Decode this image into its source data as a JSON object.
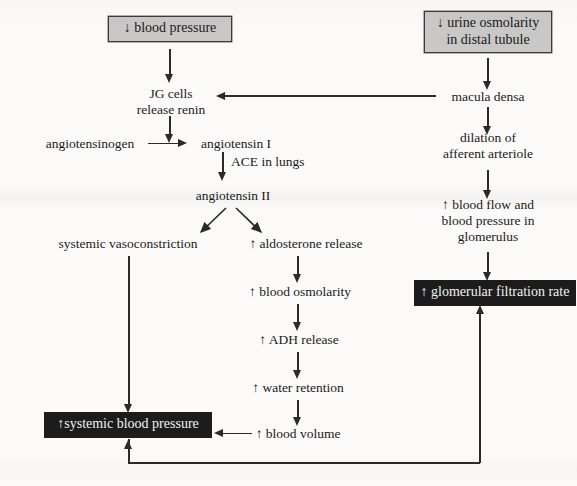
{
  "diagram": {
    "colors": {
      "page_background": "#fbfaf8",
      "stroke": "#2a2a2a",
      "grey_box_fill": "#c9c8c6",
      "grey_box_border": "#3a3a3a",
      "dark_box_fill": "#1c1c1c",
      "dark_box_text": "#f2f1ef"
    },
    "nodes": {
      "blood_pressure_down": "↓ blood pressure",
      "urine_osmolarity_down": "↓ urine osmolarity\nin distal tubule",
      "jg_cells": "JG cells\nrelease renin",
      "macula_densa": "macula densa",
      "angiotensinogen": "angiotensinogen",
      "angiotensin_i": "angiotensin I",
      "ace_in_lungs": "ACE in lungs",
      "angiotensin_ii": "angiotensin II",
      "dilation_afferent": "dilation of\nafferent arteriole",
      "systemic_vasoconstriction": "systemic vasoconstriction",
      "aldosterone_release": "↑ aldosterone release",
      "blood_flow_glomerulus": "↑ blood flow and\nblood pressure in\nglomerulus",
      "blood_osmolarity": "↑ blood osmolarity",
      "gfr": "↑ glomerular filtration rate",
      "adh_release": "↑ ADH release",
      "water_retention": "↑ water retention",
      "blood_volume": "↑ blood volume",
      "systemic_blood_pressure": "↑systemic blood pressure"
    },
    "edges": [
      {
        "from": "blood_pressure_down",
        "to": "jg_cells",
        "kind": "arrow-down"
      },
      {
        "from": "urine_osmolarity_down",
        "to": "macula_densa",
        "kind": "arrow-down"
      },
      {
        "from": "macula_densa",
        "to": "jg_cells",
        "kind": "arrow-left"
      },
      {
        "from": "jg_cells",
        "to": "angiotensin_i",
        "kind": "arrow-down"
      },
      {
        "from": "angiotensinogen",
        "to": "angiotensin_i",
        "kind": "arrow-right"
      },
      {
        "from": "angiotensin_i",
        "to": "angiotensin_ii",
        "kind": "arrow-down",
        "label": "ACE in lungs"
      },
      {
        "from": "angiotensin_ii",
        "to": "systemic_vasoconstriction",
        "kind": "arrow-diagonal-left"
      },
      {
        "from": "angiotensin_ii",
        "to": "aldosterone_release",
        "kind": "arrow-diagonal-right"
      },
      {
        "from": "macula_densa",
        "to": "dilation_afferent",
        "kind": "arrow-down"
      },
      {
        "from": "dilation_afferent",
        "to": "blood_flow_glomerulus",
        "kind": "arrow-down"
      },
      {
        "from": "blood_flow_glomerulus",
        "to": "gfr",
        "kind": "arrow-down"
      },
      {
        "from": "systemic_vasoconstriction",
        "to": "systemic_blood_pressure",
        "kind": "arrow-down"
      },
      {
        "from": "aldosterone_release",
        "to": "blood_osmolarity",
        "kind": "arrow-down"
      },
      {
        "from": "blood_osmolarity",
        "to": "adh_release",
        "kind": "arrow-down"
      },
      {
        "from": "adh_release",
        "to": "water_retention",
        "kind": "arrow-down"
      },
      {
        "from": "water_retention",
        "to": "blood_volume",
        "kind": "arrow-down"
      },
      {
        "from": "blood_volume",
        "to": "systemic_blood_pressure",
        "kind": "arrow-left"
      },
      {
        "from": "systemic_blood_pressure",
        "to": "gfr",
        "kind": "feedback-loop-bottom"
      }
    ]
  }
}
